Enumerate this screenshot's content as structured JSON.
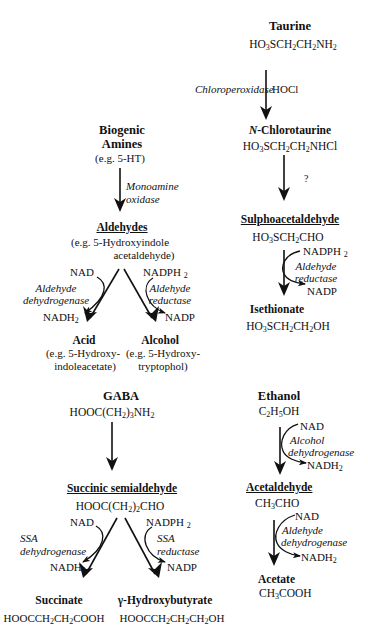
{
  "taurine_pathway": {
    "taurine": {
      "name": "Taurine",
      "formula": [
        "HO",
        "3",
        "SCH",
        "2",
        "CH",
        "2",
        "NH",
        "2"
      ]
    },
    "step1": {
      "enzyme": "Chloroperoxidase",
      "cofactor": "HOCl"
    },
    "n_chlorotaurine": {
      "name_prefix": "N",
      "name_rest": "-Chlorotaurine",
      "formula": [
        "HO",
        "3",
        "SCH",
        "2",
        "CH",
        "2",
        "NHCl"
      ]
    },
    "step2": {
      "label": "?"
    },
    "sulphoacetaldehyde": {
      "name": "Sulphoacetaldehyde",
      "formula": [
        "HO",
        "3",
        "SCH",
        "2",
        "CHO"
      ]
    },
    "step3": {
      "cofactor_in": "NADPH",
      "cofactor_in_sub": "2",
      "enzyme_line1": "Aldehyde",
      "enzyme_line2": "reductase",
      "cofactor_out": "NADP"
    },
    "isethionate": {
      "name": "Isethionate",
      "formula": [
        "HO",
        "3",
        "SCH",
        "2",
        "CH",
        "2",
        "OH"
      ]
    }
  },
  "biogenic_pathway": {
    "amines": {
      "name_line1": "Biogenic",
      "name_line2": "Amines",
      "example": "(e.g. 5-HT)"
    },
    "step1": {
      "enzyme_line1": "Monoamine",
      "enzyme_line2": "oxidase"
    },
    "aldehydes": {
      "name": "Aldehydes",
      "example_line1": "(e.g. 5-Hydroxyindole",
      "example_line2": "acetaldehyde)"
    },
    "left_branch": {
      "cofactor_in": "NAD",
      "enzyme_line1": "Aldehyde",
      "enzyme_line2": "dehydrogenase",
      "cofactor_out": "NADH",
      "cofactor_out_sub": "2"
    },
    "right_branch": {
      "cofactor_in": "NADPH",
      "cofactor_in_sub": "2",
      "enzyme_line1": "Aldehyde",
      "enzyme_line2": "reductase",
      "cofactor_out": "NADP"
    },
    "acid": {
      "name": "Acid",
      "example_line1": "(e.g. 5-Hydroxy-",
      "example_line2": "indoleacetate)"
    },
    "alcohol": {
      "name": "Alcohol",
      "example_line1": "(e.g. 5-Hydroxy-",
      "example_line2": "tryptophol)"
    }
  },
  "gaba_pathway": {
    "gaba": {
      "name": "GABA",
      "formula": [
        "HOOC(CH",
        "2",
        ")",
        "3",
        "NH",
        "2"
      ]
    },
    "ssa": {
      "name": "Succinic semialdehyde",
      "formula": [
        "HOOC(CH",
        "2",
        ")",
        "2",
        "CHO"
      ]
    },
    "left_branch": {
      "cofactor_in": "NAD",
      "enzyme_line1": "SSA",
      "enzyme_line2": "dehydrogenase",
      "cofactor_out": "NADH",
      "cofactor_out_sub": "2"
    },
    "right_branch": {
      "cofactor_in": "NADPH",
      "cofactor_in_sub": "2",
      "enzyme_line1": "SSA",
      "enzyme_line2": "reductase",
      "cofactor_out": "NADP"
    },
    "succinate": {
      "name": "Succinate",
      "formula": [
        "HOOCCH",
        "2",
        "CH",
        "2",
        "COOH"
      ]
    },
    "ghb": {
      "name": "γ-Hydroxybutyrate",
      "formula": [
        "HOOCCH",
        "2",
        "CH",
        "2",
        "CH",
        "2",
        "OH"
      ]
    }
  },
  "ethanol_pathway": {
    "ethanol": {
      "name": "Ethanol",
      "formula": [
        "C",
        "2",
        "H",
        "5",
        "OH"
      ]
    },
    "step1": {
      "cofactor_in": "NAD",
      "enzyme_line1": "Alcohol",
      "enzyme_line2": "dehydrogenase",
      "cofactor_out": "NADH",
      "cofactor_out_sub": "2"
    },
    "acetaldehyde": {
      "name": "Acetaldehyde",
      "formula": [
        "CH",
        "3",
        "CHO"
      ]
    },
    "step2": {
      "cofactor_in": "NAD",
      "enzyme_line1": "Aldehyde",
      "enzyme_line2": "dehydrogenase",
      "cofactor_out": "NADH",
      "cofactor_out_sub": "2"
    },
    "acetate": {
      "name": "Acetate",
      "formula": [
        "CH",
        "3",
        "COOH"
      ]
    }
  }
}
